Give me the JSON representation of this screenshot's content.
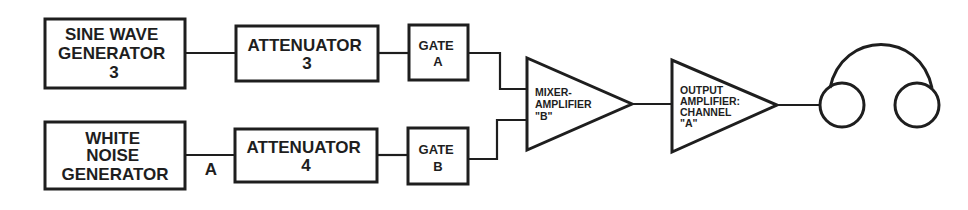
{
  "diagram": {
    "colors": {
      "stroke": "#1e1e1e",
      "background": "#ffffff"
    },
    "nodes": {
      "sine_wave_generator": {
        "lines": [
          "SINE WAVE",
          "GENERATOR",
          "3"
        ]
      },
      "white_noise_generator": {
        "lines": [
          "WHITE",
          "NOISE",
          "GENERATOR"
        ]
      },
      "attenuator_3": {
        "lines": [
          "ATTENUATOR",
          "3"
        ]
      },
      "attenuator_4": {
        "lines": [
          "ATTENUATOR",
          "4"
        ]
      },
      "gate_a": {
        "lines": [
          "GATE",
          "A"
        ]
      },
      "gate_b": {
        "lines": [
          "GATE",
          "B"
        ]
      },
      "mixer_amplifier": {
        "lines": [
          "MIXER-",
          "AMPLIFIER",
          "\"B\""
        ]
      },
      "output_amplifier": {
        "lines": [
          "OUTPUT",
          "AMPLIFIER:",
          "CHANNEL",
          "\"A\""
        ]
      },
      "headphones": {
        "icon": "headphones-icon"
      }
    },
    "edge_labels": {
      "noise_to_attenuator": "A"
    },
    "edges": [
      [
        "sine_wave_generator",
        "attenuator_3"
      ],
      [
        "attenuator_3",
        "gate_a"
      ],
      [
        "gate_a",
        "mixer_amplifier"
      ],
      [
        "white_noise_generator",
        "attenuator_4"
      ],
      [
        "attenuator_4",
        "gate_b"
      ],
      [
        "gate_b",
        "mixer_amplifier"
      ],
      [
        "mixer_amplifier",
        "output_amplifier"
      ],
      [
        "output_amplifier",
        "headphones"
      ]
    ]
  }
}
